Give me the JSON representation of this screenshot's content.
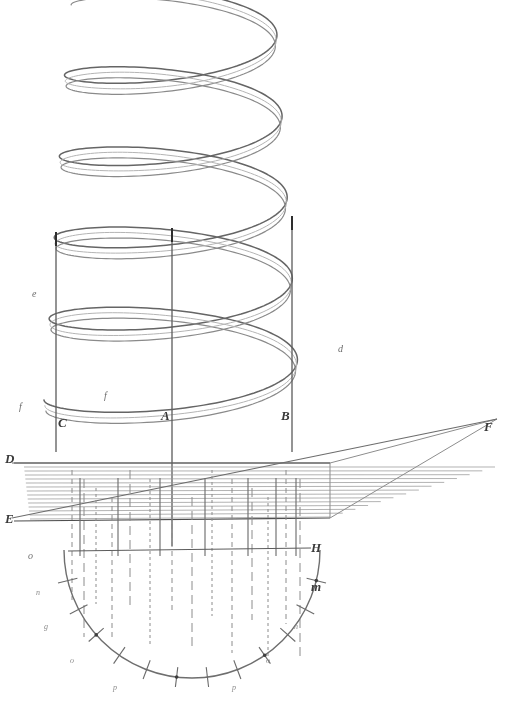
{
  "figure": {
    "kind": "technical-line-drawing",
    "background_color": "#ffffff",
    "ink_color": "#5a5a5a",
    "ink_color_dark": "#3a3a3a",
    "ink_color_faint": "#9a9a9a",
    "width": 515,
    "height": 707
  },
  "labels": {
    "major": [
      {
        "id": "axis-c",
        "text": "C",
        "x": 58,
        "y": 416,
        "cls": "lbl-major"
      },
      {
        "id": "axis-a",
        "text": "A",
        "x": 161,
        "y": 409,
        "cls": "lbl-major"
      },
      {
        "id": "axis-b",
        "text": "B",
        "x": 281,
        "y": 409,
        "cls": "lbl-major"
      },
      {
        "id": "plane-d",
        "text": "D",
        "x": 5,
        "y": 452,
        "cls": "lbl-major"
      },
      {
        "id": "plane-e",
        "text": "E",
        "x": 5,
        "y": 512,
        "cls": "lbl-major"
      },
      {
        "id": "ray-f",
        "text": "F",
        "x": 484,
        "y": 420,
        "cls": "lbl-major"
      },
      {
        "id": "chord-h",
        "text": "H",
        "x": 311,
        "y": 541,
        "cls": "lbl-major"
      },
      {
        "id": "arc-m",
        "text": "m",
        "x": 311,
        "y": 580,
        "cls": "lbl-major"
      }
    ],
    "minor": [
      {
        "id": "helix-e-left",
        "text": "e",
        "x": 32,
        "y": 289,
        "cls": "lbl-minor"
      },
      {
        "id": "helix-d-right",
        "text": "d",
        "x": 338,
        "y": 344,
        "cls": "lbl-minor"
      },
      {
        "id": "helix-f-left",
        "text": "f",
        "x": 19,
        "y": 402,
        "cls": "lbl-minor"
      },
      {
        "id": "helix-f-mid",
        "text": "f",
        "x": 104,
        "y": 391,
        "cls": "lbl-minor"
      },
      {
        "id": "arc-marker-o",
        "text": "o",
        "x": 28,
        "y": 551,
        "cls": "lbl-minor"
      }
    ],
    "ticks": [
      {
        "id": "tick-label-1",
        "text": "n",
        "x": 36,
        "y": 589,
        "cls": "lbl-tick"
      },
      {
        "id": "tick-label-2",
        "text": "g",
        "x": 44,
        "y": 623,
        "cls": "lbl-tick"
      },
      {
        "id": "tick-label-3",
        "text": "o",
        "x": 70,
        "y": 657,
        "cls": "lbl-tick"
      },
      {
        "id": "tick-label-4",
        "text": "p",
        "x": 113,
        "y": 684,
        "cls": "lbl-tick"
      },
      {
        "id": "tick-label-5",
        "text": "p",
        "x": 232,
        "y": 684,
        "cls": "lbl-tick"
      },
      {
        "id": "tick-label-6",
        "text": "o",
        "x": 266,
        "y": 657,
        "cls": "lbl-tick"
      },
      {
        "id": "tick-label-7",
        "text": "n",
        "x": 294,
        "y": 623,
        "cls": "lbl-tick"
      }
    ]
  },
  "chart_data": {
    "type": "line",
    "title": "",
    "subtitle": "",
    "xlabel": "",
    "ylabel": "",
    "grid": false,
    "legend_position": "none",
    "xlim": [
      0,
      515
    ],
    "ylim": [
      707,
      0
    ],
    "elements": {
      "helix": {
        "turns": 5,
        "center_x": 172,
        "top_y": -6,
        "bottom_y": 400,
        "radius_x": 128,
        "radius_y": 30,
        "band_thickness": 11,
        "stroke": "#6b6b6b"
      },
      "axis_lines": [
        {
          "name": "C",
          "x": 56,
          "y1": 232,
          "y2": 452
        },
        {
          "name": "A",
          "x": 172,
          "y1": 228,
          "y2": 546
        },
        {
          "name": "B",
          "x": 292,
          "y1": 216,
          "y2": 452
        }
      ],
      "plane_band": {
        "top_line_y": 463,
        "bottom_line_y": 521,
        "left_x": 14,
        "right_x": 330,
        "hatch_count": 14,
        "stroke": "#8f8f8f"
      },
      "ray_F": {
        "x1": 12,
        "y1": 470,
        "x2": 497,
        "y2": 419
      },
      "arc": {
        "center_x": 192,
        "center_y": 550,
        "radius": 128,
        "start_angle_deg": 0,
        "end_angle_deg": 180,
        "tick_count": 13,
        "stroke": "#7a7a7a"
      },
      "chord_H": {
        "x1": 68,
        "y1": 551,
        "x2": 311,
        "y2": 548
      }
    },
    "series": [
      {
        "name": "helix-outer",
        "points_note": "parametric helix x = 172 + 128*cos(t), y = -6 + 406*t/(2*pi*5) + 30*sin(t)"
      },
      {
        "name": "helix-inner",
        "points_note": "same parametric path offset 11px downward to form a ribbon"
      }
    ]
  }
}
